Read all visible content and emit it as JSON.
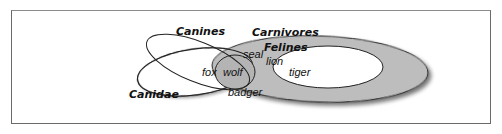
{
  "diagram": {
    "type": "venn",
    "sets": [
      {
        "id": "canines",
        "label": "Canines"
      },
      {
        "id": "canidae",
        "label": "Canidae"
      },
      {
        "id": "carnivores",
        "label": "Carnivores"
      },
      {
        "id": "felines",
        "label": "Felines"
      }
    ],
    "members": [
      {
        "label": "fox"
      },
      {
        "label": "wolf"
      },
      {
        "label": "seal"
      },
      {
        "label": "badger"
      },
      {
        "label": "lion"
      },
      {
        "label": "tiger"
      }
    ],
    "colors": {
      "carnivores_fill": "#bdbdbd",
      "wolf_fill": "#b4b4b4",
      "felines_fill": "#ffffff",
      "outline": "#222222",
      "shadow": "#8c8c8c",
      "frame": "#6a6a6a"
    }
  }
}
